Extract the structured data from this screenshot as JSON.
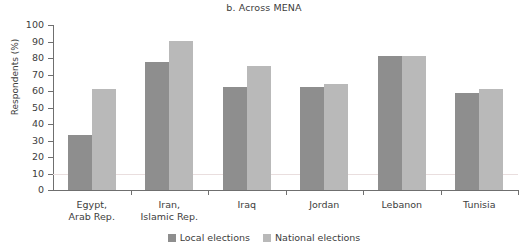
{
  "chart_data": {
    "type": "bar",
    "title": "b. Across MENA",
    "xlabel": "",
    "ylabel": "Respondents (%)",
    "ylim": [
      0,
      100
    ],
    "ytick_step": 10,
    "yticks": [
      100,
      90,
      80,
      70,
      60,
      50,
      40,
      30,
      20,
      10,
      0
    ],
    "grid": "single faint horizontal line at 10",
    "legend_position": "bottom-center",
    "categories": [
      "Egypt, Arab Rep.",
      "Iran, Islamic Rep.",
      "Iraq",
      "Jordan",
      "Lebanon",
      "Tunisia"
    ],
    "category_lines": [
      [
        "Egypt,",
        "Arab Rep."
      ],
      [
        "Iran,",
        "Islamic Rep."
      ],
      [
        "Iraq"
      ],
      [
        "Jordan"
      ],
      [
        "Lebanon"
      ],
      [
        "Tunisia"
      ]
    ],
    "series": [
      {
        "name": "Local elections",
        "color": "#8e8e8e",
        "values": [
          33.5,
          77.5,
          62.5,
          62.5,
          81.0,
          58.5
        ]
      },
      {
        "name": "National elections",
        "color": "#b9b9b9",
        "values": [
          61.0,
          90.5,
          75.0,
          64.0,
          81.5,
          61.0
        ]
      }
    ]
  },
  "legend": {
    "items": [
      {
        "label": "Local elections",
        "swatch": "local"
      },
      {
        "label": "National elections",
        "swatch": "national"
      }
    ]
  },
  "colors": {
    "local": "#8e8e8e",
    "national": "#b9b9b9",
    "axis": "#6f6f6f",
    "gridline": "#e9dede",
    "text": "#3d3d3d",
    "background": "#ffffff"
  }
}
